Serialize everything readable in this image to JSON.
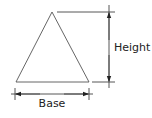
{
  "diagram": {
    "labels": {
      "height": "Height",
      "base": "Base"
    },
    "colors": {
      "stroke": "#3a3a3a",
      "text": "#222222",
      "background": "#ffffff"
    }
  }
}
